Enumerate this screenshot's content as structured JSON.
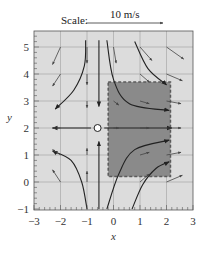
{
  "figure": {
    "scale": {
      "label": "Scale:",
      "value_label": "10 m/s"
    },
    "axes": {
      "xlabel": "x",
      "ylabel": "y",
      "xlim": [
        -3,
        3
      ],
      "ylim": [
        -1,
        5.6
      ],
      "xticks": [
        "−3",
        "−2",
        "−1",
        "0",
        "1",
        "2",
        "3"
      ],
      "yticks": [
        "−1",
        "0",
        "1",
        "2",
        "3",
        "4",
        "5"
      ],
      "grid": true
    },
    "colors": {
      "plot_background": "#dcdcdc",
      "grid": "#a8a8a8",
      "shaded_region": "#8a8a8a",
      "shaded_border": "#5a5a5a",
      "streamline": "#222222",
      "vector": "#444444"
    },
    "shaded_region": {
      "x0": -0.2,
      "x1": 2.15,
      "y0": 0.2,
      "y1": 3.7
    },
    "stagnation_point": {
      "x": -0.6,
      "y": 2.0
    },
    "streamlines": [
      {
        "points": [
          [
            -1.05,
            5.25
          ],
          [
            -1.1,
            4.3
          ],
          [
            -1.5,
            3.4
          ],
          [
            -2.2,
            2.7
          ]
        ]
      },
      {
        "points": [
          [
            -0.55,
            5.25
          ],
          [
            -0.55,
            2.8
          ]
        ]
      },
      {
        "points": [
          [
            -0.85,
            2.0
          ],
          [
            -2.3,
            2.0
          ]
        ]
      },
      {
        "points": [
          [
            -1.0,
            -1.0
          ],
          [
            -1.2,
            0.0
          ],
          [
            -1.6,
            0.8
          ],
          [
            -2.3,
            1.15
          ]
        ]
      },
      {
        "points": [
          [
            -0.55,
            -1.0
          ],
          [
            -0.55,
            1.5
          ]
        ]
      },
      {
        "points": [
          [
            -0.25,
            5.25
          ],
          [
            0.0,
            3.8
          ],
          [
            0.6,
            2.9
          ],
          [
            2.1,
            2.65
          ]
        ]
      },
      {
        "points": [
          [
            0.8,
            5.2
          ],
          [
            1.3,
            4.2
          ],
          [
            2.0,
            3.6
          ]
        ]
      },
      {
        "points": [
          [
            -0.35,
            2.0
          ],
          [
            2.2,
            2.0
          ]
        ]
      },
      {
        "points": [
          [
            -0.25,
            -1.0
          ],
          [
            0.2,
            0.3
          ],
          [
            0.8,
            1.2
          ],
          [
            2.1,
            1.55
          ]
        ]
      },
      {
        "points": [
          [
            0.7,
            -1.0
          ],
          [
            1.1,
            -0.1
          ],
          [
            1.6,
            0.5
          ],
          [
            2.1,
            0.75
          ]
        ]
      }
    ],
    "vectors": [
      {
        "x": -2.0,
        "y": 5.0,
        "dx": -0.3,
        "dy": -0.65
      },
      {
        "x": -1.0,
        "y": 5.0,
        "dx": 0.0,
        "dy": -0.6
      },
      {
        "x": 0.0,
        "y": 5.0,
        "dx": 0.1,
        "dy": -0.6
      },
      {
        "x": 1.0,
        "y": 5.0,
        "dx": 0.45,
        "dy": -0.5
      },
      {
        "x": 2.0,
        "y": 5.0,
        "dx": 0.65,
        "dy": -0.45
      },
      {
        "x": -2.0,
        "y": 4.0,
        "dx": -0.3,
        "dy": -0.45
      },
      {
        "x": -1.0,
        "y": 4.0,
        "dx": 0.0,
        "dy": -0.4
      },
      {
        "x": 1.0,
        "y": 4.0,
        "dx": 0.35,
        "dy": -0.3
      },
      {
        "x": 2.0,
        "y": 4.0,
        "dx": 0.6,
        "dy": -0.25
      },
      {
        "x": -1.0,
        "y": 3.0,
        "dx": 0.0,
        "dy": -0.25
      },
      {
        "x": 0.0,
        "y": 3.0,
        "dx": 0.2,
        "dy": -0.15
      },
      {
        "x": 1.0,
        "y": 3.0,
        "dx": 0.35,
        "dy": -0.1
      },
      {
        "x": 2.0,
        "y": 3.0,
        "dx": 0.55,
        "dy": -0.1
      },
      {
        "x": -2.0,
        "y": 2.0,
        "dx": -0.3,
        "dy": 0.0
      },
      {
        "x": 0.0,
        "y": 2.0,
        "dx": 0.2,
        "dy": 0.0
      },
      {
        "x": 1.0,
        "y": 2.0,
        "dx": 0.35,
        "dy": 0.0
      },
      {
        "x": 2.0,
        "y": 2.0,
        "dx": 0.55,
        "dy": 0.0
      },
      {
        "x": -2.0,
        "y": 1.0,
        "dx": -0.3,
        "dy": 0.2
      },
      {
        "x": -1.0,
        "y": 1.0,
        "dx": 0.0,
        "dy": 0.25
      },
      {
        "x": 1.0,
        "y": 1.0,
        "dx": 0.35,
        "dy": 0.1
      },
      {
        "x": 2.0,
        "y": 1.0,
        "dx": 0.55,
        "dy": 0.1
      },
      {
        "x": -2.0,
        "y": 0.0,
        "dx": -0.3,
        "dy": 0.45
      },
      {
        "x": -1.0,
        "y": 0.0,
        "dx": 0.0,
        "dy": 0.4
      },
      {
        "x": 1.0,
        "y": 0.0,
        "dx": 0.35,
        "dy": 0.3
      },
      {
        "x": 2.0,
        "y": 0.0,
        "dx": 0.6,
        "dy": 0.25
      }
    ]
  }
}
